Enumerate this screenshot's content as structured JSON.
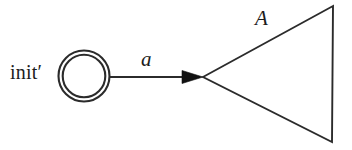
{
  "figure": {
    "kind": "automaton-fragment-diagram",
    "background_color": "#ffffff",
    "stroke_color": "#2b2b2b",
    "width": 352,
    "height": 150,
    "initial_state": {
      "label": "init′",
      "shape": "double-circle",
      "center_x": 84,
      "center_y": 76,
      "outer_radius": 25.5,
      "inner_radius": 21.5
    },
    "transition": {
      "label": "a",
      "style": "italic",
      "from_x": 110,
      "to_x": 203,
      "y": 77,
      "arrowhead": "filled-triangle"
    },
    "module": {
      "label": "A",
      "style": "italic",
      "shape": "triangle",
      "apex_x": 203,
      "apex_y": 77,
      "top_right_x": 333,
      "top_right_y": 6,
      "bottom_right_x": 332,
      "bottom_right_y": 142
    }
  }
}
